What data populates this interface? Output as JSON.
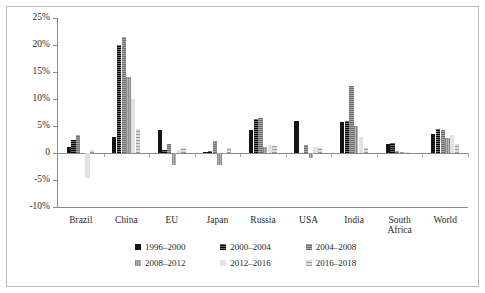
{
  "chart_data": {
    "type": "bar",
    "title": "",
    "subtitle": "",
    "xlabel": "",
    "ylabel": "",
    "ylim": [
      -10,
      25
    ],
    "yticks": [
      25,
      20,
      15,
      10,
      5,
      0,
      -5,
      -10
    ],
    "ytick_labels": [
      "25%",
      "20%",
      "15%",
      "10%",
      "5%",
      "0",
      "-5%",
      "-10%"
    ],
    "grid": false,
    "legend_position": "bottom",
    "categories": [
      "Brazil",
      "China",
      "EU",
      "Japan",
      "Russia",
      "USA",
      "India",
      "South\nAfrica",
      "World"
    ],
    "series": [
      {
        "name": "1996-2000",
        "values": [
          1.2,
          3.0,
          4.2,
          0.1,
          4.3,
          6.0,
          5.8,
          1.6,
          3.6
        ]
      },
      {
        "name": "2000-2004",
        "values": [
          2.5,
          20.0,
          0.5,
          0.4,
          6.3,
          0.0,
          6.0,
          1.9,
          4.4
        ]
      },
      {
        "name": "2004-2008",
        "values": [
          3.4,
          21.5,
          1.7,
          2.2,
          6.5,
          1.4,
          12.5,
          0.4,
          4.2
        ]
      },
      {
        "name": "2008-2012",
        "values": [
          0.0,
          14.0,
          -2.2,
          -2.3,
          1.1,
          -0.9,
          5.0,
          0.1,
          2.8
        ]
      },
      {
        "name": "2012-2016",
        "values": [
          -4.7,
          10.0,
          0.6,
          0.0,
          1.5,
          1.2,
          3.0,
          0.2,
          3.4
        ]
      },
      {
        "name": "2016-2018",
        "values": [
          0.6,
          4.5,
          0.9,
          1.0,
          1.3,
          1.0,
          1.0,
          0.0,
          1.7
        ]
      }
    ]
  },
  "legend": {
    "items": [
      {
        "label": "1996–2000",
        "swatch": "series-0-swatch"
      },
      {
        "label": "2000–2004",
        "swatch": "series-1-swatch"
      },
      {
        "label": "2004–2008",
        "swatch": "series-2-swatch"
      },
      {
        "label": "2008–2012",
        "swatch": "series-3-swatch"
      },
      {
        "label": "2012–2016",
        "swatch": "series-4-swatch"
      },
      {
        "label": "2016–2018",
        "swatch": "series-5-swatch"
      }
    ]
  },
  "colors": {
    "series": [
      "#141414",
      "#2a2a2a",
      "#8e8e8e",
      "#9c9c9c",
      "#e2e2e2",
      "#bdbdbd"
    ],
    "axis": "#8a8a8a",
    "frame": "#b9b9b9",
    "text": "#2b2b2b",
    "background": "#ffffff"
  }
}
